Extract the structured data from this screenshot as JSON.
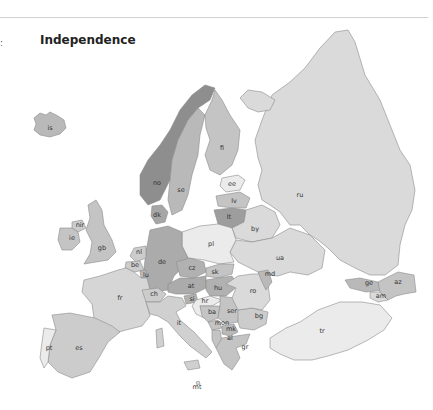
{
  "header": {
    "title": "Independence",
    "edge_mark": ":"
  },
  "legend_shades": {
    "darkest": "#8e8e8e",
    "dark": "#9d9d9d",
    "medium_dark": "#ababab",
    "medium": "#b9b9b9",
    "light": "#cccccc",
    "lighter": "#dadada",
    "lightest": "#ebebeb"
  },
  "countries": {
    "is": {
      "label": "is",
      "fill": "#b9b9b9"
    },
    "no": {
      "label": "no",
      "fill": "#8e8e8e"
    },
    "se": {
      "label": "se",
      "fill": "#b9b9b9"
    },
    "fi": {
      "label": "fi",
      "fill": "#c4c4c4"
    },
    "dk": {
      "label": "dk",
      "fill": "#a6a6a6"
    },
    "ee": {
      "label": "ee",
      "fill": "#ebebeb"
    },
    "lv": {
      "label": "lv",
      "fill": "#c4c4c4"
    },
    "lt": {
      "label": "lt",
      "fill": "#9d9d9d"
    },
    "ru": {
      "label": "ru",
      "fill": "#dadada"
    },
    "by": {
      "label": "by",
      "fill": "#dadada"
    },
    "ua": {
      "label": "ua",
      "fill": "#dadada"
    },
    "pl": {
      "label": "pl",
      "fill": "#ebebeb"
    },
    "de": {
      "label": "de",
      "fill": "#ababab"
    },
    "nl": {
      "label": "nl",
      "fill": "#cccccc"
    },
    "be": {
      "label": "be",
      "fill": "#cccccc"
    },
    "lu": {
      "label": "lu",
      "fill": "#b9b9b9"
    },
    "gb": {
      "label": "gb",
      "fill": "#c4c4c4"
    },
    "nir": {
      "label": "nir",
      "fill": "#cccccc"
    },
    "ie": {
      "label": "ie",
      "fill": "#c4c4c4"
    },
    "fr": {
      "label": "fr",
      "fill": "#d6d6d6"
    },
    "ch": {
      "label": "ch",
      "fill": "#cccccc"
    },
    "it": {
      "label": "it",
      "fill": "#d0d0d0"
    },
    "cz": {
      "label": "cz",
      "fill": "#b1b1b1"
    },
    "sk": {
      "label": "sk",
      "fill": "#c4c4c4"
    },
    "at": {
      "label": "at",
      "fill": "#ababab"
    },
    "hu": {
      "label": "hu",
      "fill": "#b1b1b1"
    },
    "si": {
      "label": "si",
      "fill": "#b1b1b1"
    },
    "hr": {
      "label": "hr",
      "fill": "#ebebeb"
    },
    "ba": {
      "label": "ba",
      "fill": "#c4c4c4"
    },
    "ser": {
      "label": "ser",
      "fill": "#c4c4c4"
    },
    "mon": {
      "label": "mon",
      "fill": "#c4c4c4"
    },
    "al": {
      "label": "al",
      "fill": "#c4c4c4"
    },
    "mk": {
      "label": "mk",
      "fill": "#b9b9b9"
    },
    "gr": {
      "label": "gr",
      "fill": "#c4c4c4"
    },
    "bg": {
      "label": "bg",
      "fill": "#cccccc"
    },
    "ro": {
      "label": "ro",
      "fill": "#dadada"
    },
    "md": {
      "label": "md",
      "fill": "#b9b9b9"
    },
    "ge": {
      "label": "ge",
      "fill": "#b9b9b9"
    },
    "am": {
      "label": "am",
      "fill": "#dadada"
    },
    "az": {
      "label": "az",
      "fill": "#c4c4c4"
    },
    "tr": {
      "label": "tr",
      "fill": "#ebebeb"
    },
    "es": {
      "label": "es",
      "fill": "#cccccc"
    },
    "pt": {
      "label": "pt",
      "fill": "#ebebeb"
    },
    "mt": {
      "label": "mt",
      "fill": "#dadada"
    }
  }
}
